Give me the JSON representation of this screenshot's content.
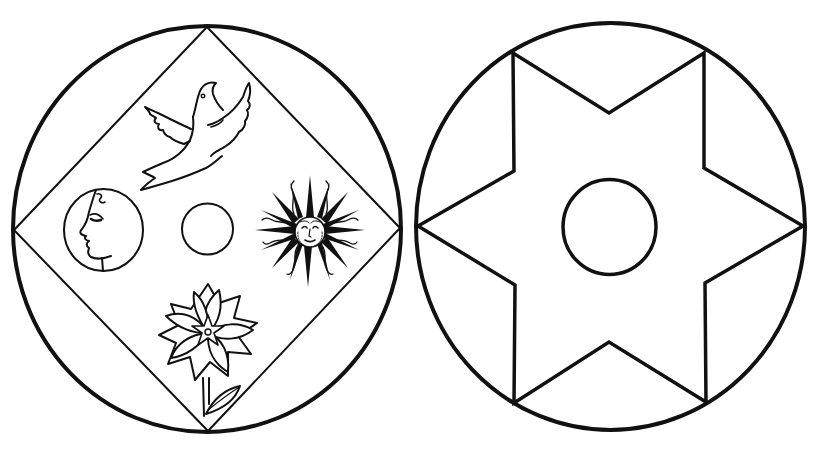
{
  "colors": {
    "background": "#ffffff",
    "stroke": "#111111"
  },
  "left_emblem": {
    "label": "Circle with inscribed diamond containing dove, moon, sun, flower and small circle",
    "elements": [
      {
        "name": "dove",
        "position": "top"
      },
      {
        "name": "moon-face",
        "position": "left"
      },
      {
        "name": "small-circle",
        "position": "center"
      },
      {
        "name": "sun-face",
        "position": "right"
      },
      {
        "name": "flower",
        "position": "bottom"
      }
    ]
  },
  "right_emblem": {
    "label": "Circle with inscribed six-pointed star and central circle",
    "elements": [
      {
        "name": "six-pointed-star",
        "position": "center"
      },
      {
        "name": "inner-circle",
        "position": "center"
      }
    ]
  }
}
